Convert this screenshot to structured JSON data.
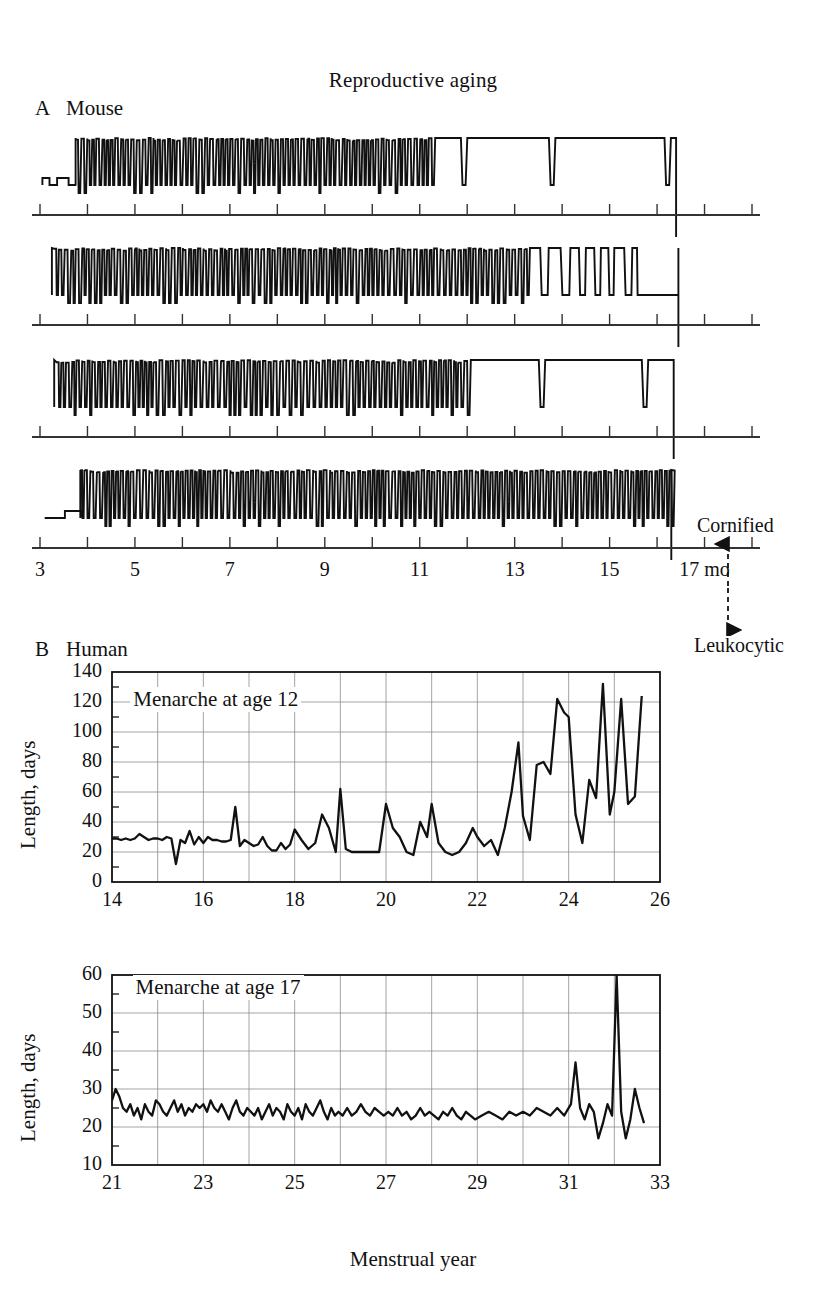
{
  "figure": {
    "title": "Reproductive aging"
  },
  "panel_a": {
    "letter": "A",
    "title": "Mouse",
    "x_axis": {
      "label_suffix": "mo",
      "tick_labels": [
        "3",
        "5",
        "7",
        "9",
        "11",
        "13",
        "15",
        "17 mo"
      ],
      "tick_values": [
        3,
        5,
        7,
        9,
        11,
        13,
        15,
        17
      ],
      "minor_ticks": [
        3,
        4,
        5,
        6,
        7,
        8,
        9,
        10,
        11,
        12,
        13,
        14,
        15,
        16,
        17,
        18
      ],
      "range": [
        3,
        18
      ]
    },
    "state_axis": {
      "high_label": "Cornified",
      "low_label": "Leukocytic"
    },
    "traces": [
      {
        "name": "mouse-1"
      },
      {
        "name": "mouse-2"
      },
      {
        "name": "mouse-3"
      },
      {
        "name": "mouse-4"
      }
    ]
  },
  "panel_b": {
    "letter": "B",
    "title": "Human",
    "x_axis_label": "Menstrual year"
  },
  "chart_data": [
    {
      "type": "line",
      "name": "menarche-age-12",
      "title": "Menarche at age 12",
      "xlabel": "Menstrual year",
      "ylabel": "Length, days",
      "xlim": [
        14,
        26
      ],
      "ylim": [
        0,
        140
      ],
      "ytick_labels": [
        "0",
        "20",
        "40",
        "60",
        "80",
        "100",
        "120",
        "140"
      ],
      "ytick_values": [
        0,
        20,
        40,
        60,
        80,
        100,
        120,
        140
      ],
      "xtick_labels": [
        "14",
        "16",
        "18",
        "20",
        "22",
        "24",
        "26"
      ],
      "xtick_values": [
        14,
        16,
        18,
        20,
        22,
        24,
        26
      ],
      "xminor_ticks": [
        14,
        15,
        16,
        17,
        18,
        19,
        20,
        21,
        22,
        23,
        24,
        25,
        26
      ],
      "grid": true,
      "x": [
        14.0,
        14.1,
        14.2,
        14.3,
        14.4,
        14.5,
        14.6,
        14.7,
        14.8,
        14.9,
        15.0,
        15.1,
        15.2,
        15.3,
        15.4,
        15.5,
        15.6,
        15.7,
        15.8,
        15.9,
        16.0,
        16.1,
        16.2,
        16.3,
        16.4,
        16.5,
        16.6,
        16.7,
        16.8,
        16.9,
        17.0,
        17.1,
        17.2,
        17.3,
        17.4,
        17.5,
        17.6,
        17.7,
        17.8,
        17.9,
        18.0,
        18.15,
        18.3,
        18.45,
        18.6,
        18.75,
        18.9,
        19.0,
        19.12,
        19.25,
        19.4,
        19.55,
        19.7,
        19.85,
        20.0,
        20.15,
        20.3,
        20.45,
        20.6,
        20.75,
        20.9,
        21.0,
        21.15,
        21.3,
        21.45,
        21.6,
        21.75,
        21.9,
        22.0,
        22.15,
        22.3,
        22.45,
        22.6,
        22.75,
        22.9,
        23.0,
        23.15,
        23.3,
        23.45,
        23.6,
        23.75,
        23.9,
        24.0,
        24.15,
        24.3,
        24.45,
        24.6,
        24.75,
        24.9,
        25.0,
        25.15,
        25.3,
        25.45,
        25.6
      ],
      "y": [
        29,
        29,
        28,
        29,
        28,
        29,
        32,
        30,
        28,
        29,
        29,
        28,
        30,
        29,
        12,
        28,
        26,
        34,
        25,
        30,
        26,
        30,
        28,
        28,
        27,
        27,
        28,
        50,
        24,
        28,
        26,
        24,
        25,
        30,
        24,
        21,
        21,
        26,
        22,
        25,
        35,
        28,
        22,
        26,
        45,
        36,
        20,
        62,
        22,
        20,
        20,
        20,
        20,
        20,
        52,
        36,
        30,
        20,
        18,
        40,
        30,
        52,
        26,
        20,
        18,
        20,
        26,
        36,
        30,
        24,
        28,
        18,
        36,
        60,
        93,
        44,
        28,
        78,
        80,
        72,
        122,
        113,
        110,
        45,
        26,
        68,
        56,
        132,
        45,
        60,
        122,
        52,
        57,
        124
      ],
      "annotation": {
        "text": "Menarche at age 12",
        "x": 14.4,
        "y": 120
      }
    },
    {
      "type": "line",
      "name": "menarche-age-17",
      "title": "Menarche at age 17",
      "xlabel": "Menstrual year",
      "ylabel": "Length, days",
      "xlim": [
        21,
        33
      ],
      "ylim": [
        10,
        60
      ],
      "ytick_labels": [
        "10",
        "20",
        "30",
        "40",
        "50",
        "60"
      ],
      "ytick_values": [
        10,
        20,
        30,
        40,
        50,
        60
      ],
      "xtick_labels": [
        "21",
        "23",
        "25",
        "27",
        "29",
        "31",
        "33"
      ],
      "xtick_values": [
        21,
        23,
        25,
        27,
        29,
        31,
        33
      ],
      "xminor_ticks": [
        21,
        22,
        23,
        24,
        25,
        26,
        27,
        28,
        29,
        30,
        31,
        32,
        33
      ],
      "grid": true,
      "x": [
        21.0,
        21.08,
        21.16,
        21.24,
        21.32,
        21.4,
        21.48,
        21.56,
        21.64,
        21.72,
        21.8,
        21.88,
        21.96,
        22.04,
        22.12,
        22.2,
        22.28,
        22.36,
        22.44,
        22.52,
        22.6,
        22.68,
        22.76,
        22.84,
        22.92,
        23.0,
        23.08,
        23.16,
        23.24,
        23.32,
        23.4,
        23.48,
        23.56,
        23.64,
        23.72,
        23.8,
        23.88,
        23.96,
        24.04,
        24.12,
        24.2,
        24.28,
        24.36,
        24.44,
        24.52,
        24.6,
        24.68,
        24.76,
        24.84,
        24.92,
        25.0,
        25.08,
        25.16,
        25.24,
        25.32,
        25.4,
        25.48,
        25.56,
        25.64,
        25.72,
        25.8,
        25.88,
        25.96,
        26.05,
        26.15,
        26.25,
        26.35,
        26.45,
        26.55,
        26.65,
        26.75,
        26.85,
        26.95,
        27.05,
        27.15,
        27.25,
        27.35,
        27.45,
        27.55,
        27.65,
        27.75,
        27.85,
        27.95,
        28.05,
        28.15,
        28.25,
        28.35,
        28.45,
        28.55,
        28.65,
        28.75,
        28.85,
        28.95,
        29.1,
        29.25,
        29.4,
        29.55,
        29.7,
        29.85,
        30.0,
        30.15,
        30.3,
        30.45,
        30.6,
        30.75,
        30.9,
        31.05,
        31.15,
        31.25,
        31.35,
        31.45,
        31.55,
        31.65,
        31.75,
        31.85,
        31.95,
        32.05,
        32.15,
        32.25,
        32.35,
        32.45,
        32.55,
        32.65
      ],
      "y": [
        27,
        30,
        28,
        25,
        24,
        26,
        23,
        25,
        22,
        26,
        24,
        23,
        27,
        26,
        24,
        23,
        25,
        27,
        24,
        26,
        23,
        25,
        24,
        26,
        25,
        26,
        24,
        27,
        25,
        24,
        26,
        24,
        22,
        25,
        27,
        24,
        23,
        25,
        24,
        23,
        25,
        22,
        24,
        26,
        23,
        25,
        24,
        22,
        26,
        24,
        23,
        25,
        22,
        26,
        24,
        23,
        25,
        27,
        24,
        22,
        25,
        23,
        24,
        23,
        25,
        23,
        24,
        26,
        24,
        23,
        25,
        24,
        23,
        24,
        23,
        25,
        23,
        24,
        22,
        23,
        25,
        23,
        24,
        23,
        22,
        24,
        23,
        25,
        23,
        22,
        24,
        23,
        22,
        23,
        24,
        23,
        22,
        24,
        23,
        24,
        23,
        25,
        24,
        23,
        25,
        23,
        26,
        37,
        25,
        22,
        26,
        24,
        17,
        21,
        26,
        23,
        60,
        24,
        17,
        22,
        30,
        25,
        21
      ],
      "annotation": {
        "text": "Menarche at age 17",
        "x": 21.45,
        "y": 56
      }
    }
  ]
}
